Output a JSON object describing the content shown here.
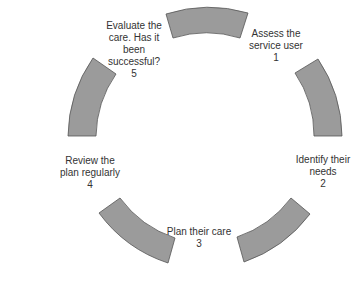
{
  "diagram": {
    "type": "cycle",
    "segment_fill": "#9b9b9b",
    "segment_stroke": "#555555",
    "steps": [
      {
        "number": "1",
        "line1": "Assess the",
        "line2": "service user"
      },
      {
        "number": "2",
        "line1": "Identify their",
        "line2": "needs"
      },
      {
        "number": "3",
        "line1": "Plan their care",
        "line2": ""
      },
      {
        "number": "4",
        "line1": "Review the",
        "line2": "plan regularly"
      },
      {
        "number": "5",
        "line1": "Evaluate the",
        "line2": "care. Has it",
        "line3": "been",
        "line4": "successful?"
      }
    ]
  }
}
